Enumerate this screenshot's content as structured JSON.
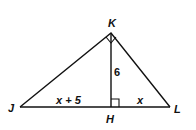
{
  "diagram": {
    "vertices": {
      "K": {
        "label": "K"
      },
      "J": {
        "label": "J"
      },
      "L": {
        "label": "L"
      },
      "H": {
        "label": "H"
      }
    },
    "segments": {
      "KH": {
        "label": "6"
      },
      "JH": {
        "label": "x + 5"
      },
      "HL": {
        "label": "x"
      }
    },
    "markers": [
      "right angle at K",
      "right angle at H"
    ],
    "colors": {
      "stroke": "#111111",
      "background": "#ffffff"
    }
  }
}
